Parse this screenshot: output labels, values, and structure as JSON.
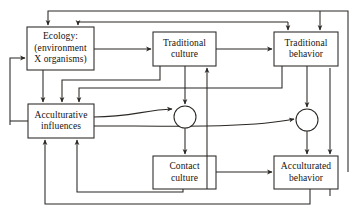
{
  "diagram": {
    "type": "flowchart",
    "stroke_color": "#2b2724",
    "background_color": "#ffffff",
    "nodes": [
      {
        "id": "ecology",
        "shape": "rectangle",
        "lines": [
          "Ecology:",
          "(environment",
          "X organisms)"
        ],
        "x": 27,
        "y": 27,
        "w": 67,
        "h": 43
      },
      {
        "id": "traditional-culture",
        "shape": "rectangle",
        "lines": [
          "Traditional",
          "culture"
        ],
        "x": 153,
        "y": 32,
        "w": 63,
        "h": 34
      },
      {
        "id": "traditional-behavior",
        "shape": "rectangle",
        "lines": [
          "Traditional",
          "behavior"
        ],
        "x": 274,
        "y": 32,
        "w": 64,
        "h": 34
      },
      {
        "id": "acculturative-influences",
        "shape": "rectangle",
        "lines": [
          "Acculturative",
          "influences"
        ],
        "x": 28,
        "y": 104,
        "w": 66,
        "h": 34
      },
      {
        "id": "contact-culture",
        "shape": "rectangle",
        "lines": [
          "Contact",
          "culture"
        ],
        "x": 153,
        "y": 156,
        "w": 63,
        "h": 33
      },
      {
        "id": "acculturated-behavior",
        "shape": "rectangle",
        "lines": [
          "Acculturated",
          "behavior"
        ],
        "x": 274,
        "y": 156,
        "w": 64,
        "h": 33
      },
      {
        "id": "junction-left",
        "shape": "circle",
        "lines": [],
        "cx": 185,
        "cy": 117,
        "r": 11
      },
      {
        "id": "junction-right",
        "shape": "circle",
        "lines": [],
        "cx": 307,
        "cy": 120,
        "r": 11
      }
    ],
    "edges": [
      {
        "id": "ecology-to-traditional-culture",
        "from": "ecology",
        "to": "traditional-culture"
      },
      {
        "id": "traditional-culture-to-traditional-behavior",
        "from": "traditional-culture",
        "to": "traditional-behavior"
      },
      {
        "id": "traditional-culture-to-junction-left",
        "from": "traditional-culture",
        "to": "junction-left"
      },
      {
        "id": "traditional-behavior-to-junction-right",
        "from": "traditional-behavior",
        "to": "junction-right"
      },
      {
        "id": "junction-left-to-contact-culture",
        "from": "junction-left",
        "to": "contact-culture"
      },
      {
        "id": "junction-right-to-acculturated-behavior",
        "from": "junction-right",
        "to": "acculturated-behavior"
      },
      {
        "id": "contact-culture-to-acculturated-behavior",
        "from": "contact-culture",
        "to": "acculturated-behavior"
      },
      {
        "id": "acculturative-influences-to-junction-left",
        "from": "acculturative-influences",
        "to": "junction-left"
      },
      {
        "id": "acculturative-influences-to-junction-right",
        "from": "acculturative-influences",
        "to": "junction-right"
      },
      {
        "id": "ecology-to-acculturative-influences",
        "from": "ecology",
        "to": "acculturative-influences"
      },
      {
        "id": "traditional-culture-to-acculturative-influences",
        "from": "traditional-culture",
        "to": "acculturative-influences"
      },
      {
        "id": "traditional-behavior-to-acculturative-influences",
        "from": "traditional-behavior",
        "to": "acculturative-influences"
      },
      {
        "id": "contact-culture-to-acculturative-influences",
        "from": "contact-culture",
        "to": "acculturative-influences"
      },
      {
        "id": "acculturated-behavior-to-acculturative-influences",
        "from": "acculturated-behavior",
        "to": "acculturative-influences"
      },
      {
        "id": "acculturated-behavior-to-ecology",
        "from": "acculturated-behavior",
        "to": "ecology"
      },
      {
        "id": "traditional-behavior-to-ecology",
        "from": "traditional-behavior",
        "to": "ecology"
      },
      {
        "id": "traditional-behavior-to-traditional-culture-feedback",
        "from": "traditional-behavior",
        "to": "traditional-behavior"
      },
      {
        "id": "acculturated-behavior-to-traditional-behavior",
        "from": "acculturated-behavior",
        "to": "traditional-behavior"
      },
      {
        "id": "contact-culture-to-traditional-culture",
        "from": "contact-culture",
        "to": "traditional-culture"
      }
    ]
  }
}
